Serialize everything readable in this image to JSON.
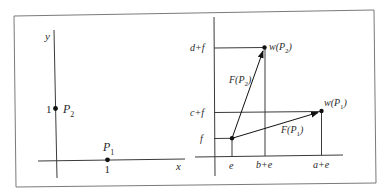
{
  "diagram": {
    "type": "coordinate-transformation",
    "colors": {
      "line": "#3a3a3a",
      "frame": "#7a7a7a",
      "point": "#111111",
      "text": "#2a2a2a"
    },
    "left_panel": {
      "axis_x_label": "x",
      "axis_y_label": "y",
      "points": [
        {
          "name": "P",
          "sub": "1",
          "label": "P1",
          "coord_label": "1",
          "position": [
            1,
            0
          ]
        },
        {
          "name": "P",
          "sub": "2",
          "label": "P2",
          "coord_label": "1",
          "position": [
            0,
            1
          ]
        }
      ],
      "tick_x": "1",
      "tick_y": "1"
    },
    "right_panel": {
      "x_ticks": [
        "e",
        "b+e",
        "a+e"
      ],
      "y_ticks": [
        "f",
        "c+f",
        "d+f"
      ],
      "points": [
        {
          "label_prefix": "w(P",
          "sub": "1",
          "label_suffix": ")",
          "full": "w(P1)"
        },
        {
          "label_prefix": "w(P",
          "sub": "2",
          "label_suffix": ")",
          "full": "w(P2)"
        }
      ],
      "vectors": [
        {
          "prefix": "F(P",
          "sub": "1",
          "suffix": ")",
          "full": "F(P1)",
          "from": "(e,f)",
          "to": "w(P1)"
        },
        {
          "prefix": "F(P",
          "sub": "2",
          "suffix": ")",
          "full": "F(P2)",
          "from": "(e,f)",
          "to": "w(P2)"
        }
      ]
    }
  }
}
